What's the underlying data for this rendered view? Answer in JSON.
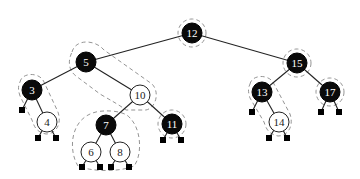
{
  "diagram": {
    "type": "red-black-tree",
    "nodes": [
      {
        "key": "12",
        "color": "black",
        "x": 192,
        "y": 33
      },
      {
        "key": "5",
        "color": "black",
        "x": 86,
        "y": 62
      },
      {
        "key": "15",
        "color": "black",
        "x": 297,
        "y": 63
      },
      {
        "key": "3",
        "color": "black",
        "x": 32,
        "y": 90
      },
      {
        "key": "10",
        "color": "red",
        "x": 140,
        "y": 95
      },
      {
        "key": "13",
        "color": "black",
        "x": 262,
        "y": 92
      },
      {
        "key": "17",
        "color": "black",
        "x": 330,
        "y": 92
      },
      {
        "key": "4",
        "color": "red",
        "x": 47,
        "y": 122
      },
      {
        "key": "7",
        "color": "black",
        "x": 106,
        "y": 125
      },
      {
        "key": "11",
        "color": "black",
        "x": 172,
        "y": 124
      },
      {
        "key": "14",
        "color": "red",
        "x": 279,
        "y": 122
      },
      {
        "key": "6",
        "color": "red",
        "x": 91,
        "y": 152
      },
      {
        "key": "8",
        "color": "red",
        "x": 120,
        "y": 152
      }
    ],
    "edges": [
      [
        "12",
        "5"
      ],
      [
        "12",
        "15"
      ],
      [
        "5",
        "3"
      ],
      [
        "5",
        "10"
      ],
      [
        "3",
        "4"
      ],
      [
        "10",
        "7"
      ],
      [
        "10",
        "11"
      ],
      [
        "7",
        "6"
      ],
      [
        "7",
        "8"
      ],
      [
        "15",
        "13"
      ],
      [
        "15",
        "17"
      ],
      [
        "13",
        "14"
      ]
    ]
  }
}
